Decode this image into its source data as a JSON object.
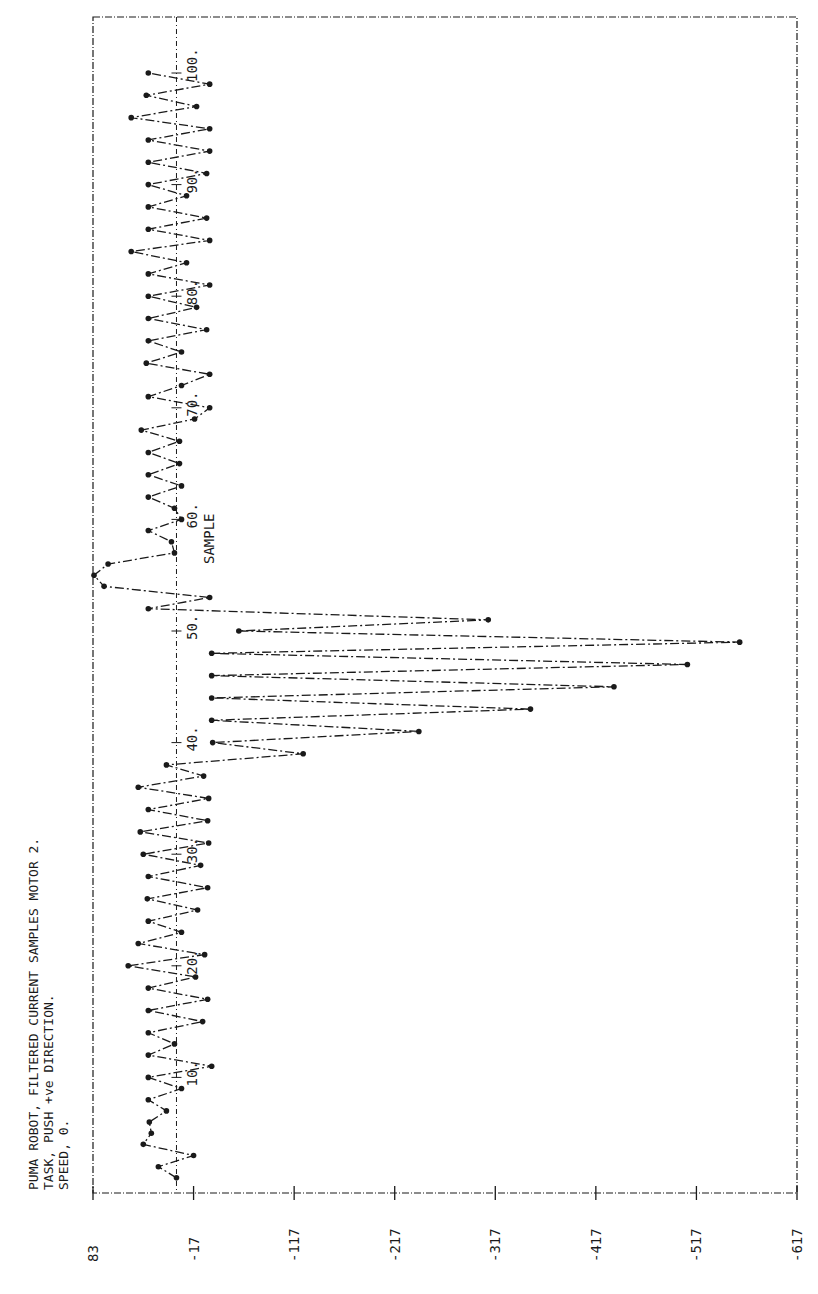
{
  "chart_data": {
    "type": "line",
    "orientation": "rotated-90-ccw",
    "title": "PUMA ROBOT, FILTERED CURRENT SAMPLES MOTOR 2.",
    "subtitle_lines": [
      "TASK, PUSH +ve DIRECTION.",
      "SPEED, 0."
    ],
    "xlabel": "SAMPLE",
    "ylabel": "",
    "x_tick_labels": [
      "10.",
      "20.",
      "30.",
      "40.",
      "50.",
      "60.",
      "70.",
      "80.",
      "90.",
      "100."
    ],
    "x_ticks": [
      10,
      20,
      30,
      40,
      50,
      60,
      70,
      80,
      90,
      100
    ],
    "y_tick_labels": [
      "83",
      "-17",
      "-117",
      "-217",
      "-317",
      "-417",
      "-517",
      "-617"
    ],
    "y_ticks": [
      83,
      -17,
      -117,
      -217,
      -317,
      -417,
      -517,
      -617
    ],
    "ylim": [
      -617,
      83
    ],
    "xlim": [
      0,
      100
    ],
    "reference_line": 0,
    "grid": false,
    "markers": true,
    "line_style": "dash-dot",
    "x": [
      1,
      2,
      3,
      4,
      5,
      6,
      7,
      8,
      9,
      10,
      11,
      12,
      13,
      14,
      15,
      16,
      17,
      18,
      19,
      20,
      21,
      22,
      23,
      24,
      25,
      26,
      27,
      28,
      29,
      30,
      31,
      32,
      33,
      34,
      35,
      36,
      37,
      38,
      39,
      40,
      41,
      42,
      43,
      44,
      45,
      46,
      47,
      48,
      49,
      50,
      51,
      52,
      53,
      54,
      55,
      56,
      57,
      58,
      59,
      60,
      61,
      62,
      63,
      64,
      65,
      66,
      67,
      68,
      69,
      70,
      71,
      72,
      73,
      74,
      75,
      76,
      77,
      78,
      79,
      80,
      81,
      82,
      83,
      84,
      85,
      86,
      87,
      88,
      89,
      90,
      91,
      92,
      93,
      94,
      95,
      96,
      97,
      98,
      99,
      100
    ],
    "values": [
      0,
      18,
      -17,
      33,
      25,
      27,
      10,
      28,
      -5,
      28,
      -35,
      28,
      2,
      28,
      -26,
      28,
      -31,
      28,
      -19,
      48,
      -28,
      38,
      -5,
      28,
      -21,
      29,
      -31,
      28,
      -24,
      33,
      -32,
      36,
      -31,
      28,
      -32,
      38,
      -27,
      10,
      -126,
      -36,
      -241,
      -35,
      -352,
      -35,
      -435,
      -35,
      -508,
      -35,
      -560,
      -62,
      -310,
      28,
      -33,
      72,
      82,
      68,
      2,
      5,
      28,
      -5,
      2,
      28,
      -5,
      28,
      -3,
      28,
      -3,
      35,
      -18,
      -33,
      28,
      -5,
      -33,
      30,
      -5,
      28,
      -30,
      28,
      -20,
      28,
      -33,
      28,
      -10,
      45,
      -33,
      28,
      -30,
      28,
      -10,
      28,
      -30,
      28,
      -33,
      28,
      -33,
      45,
      -20,
      30,
      -33,
      28
    ]
  },
  "frame": {
    "left_px": 93,
    "right_px": 797,
    "top_px": 17,
    "bottom_px": 1193
  },
  "colors": {
    "ink": "#1a1a1a",
    "paper": "#ffffff"
  }
}
